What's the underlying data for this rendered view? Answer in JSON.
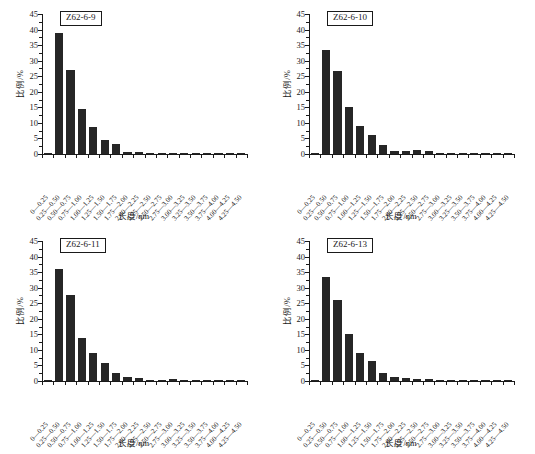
{
  "figure": {
    "panel_count": 4,
    "background_color": "#ffffff",
    "bar_color": "#262626",
    "axis_color": "#1a1a1a"
  },
  "chart_data": [
    {
      "type": "bar",
      "title": "Z62-6-9",
      "xlabel": "长度/nm",
      "ylabel": "比例/%",
      "ylim": [
        0,
        45
      ],
      "yticks": [
        0,
        5,
        10,
        15,
        20,
        25,
        30,
        35,
        40,
        45
      ],
      "grid": false,
      "legend": "none",
      "categories": [
        "0—0.25",
        "0.25—0.50",
        "0.50—0.75",
        "0.75—1.00",
        "1.00—1.25",
        "1.25—1.50",
        "1.50—1.75",
        "1.75—2.00",
        "2.00—2.25",
        "2.25—2.50",
        "2.50—2.75",
        "2.75—3.00",
        "3.00—3.25",
        "3.25—3.50",
        "3.50—3.75",
        "3.75—4.00",
        "4.00—4.25",
        "4.25—4.50"
      ],
      "values": [
        0.3,
        38.8,
        27.0,
        14.5,
        8.6,
        4.4,
        3.1,
        0.8,
        0.5,
        0.4,
        0.3,
        0.3,
        0.2,
        0.2,
        0.2,
        0.2,
        0.2,
        0.2
      ]
    },
    {
      "type": "bar",
      "title": "Z62-6-10",
      "xlabel": "长度/nm",
      "ylabel": "比例/%",
      "ylim": [
        0,
        45
      ],
      "yticks": [
        0,
        5,
        10,
        15,
        20,
        25,
        30,
        35,
        40,
        45
      ],
      "grid": false,
      "legend": "none",
      "categories": [
        "0—0.25",
        "0.25—0.50",
        "0.50—0.75",
        "0.75—1.00",
        "1.00—1.25",
        "1.25—1.50",
        "1.50—1.75",
        "1.75—2.00",
        "2.00—2.25",
        "2.25—2.50",
        "2.50—2.75",
        "2.75—3.00",
        "3.00—3.25",
        "3.25—3.50",
        "3.50—3.75",
        "3.75—4.00",
        "4.00—4.25",
        "4.25—4.50"
      ],
      "values": [
        0.4,
        33.3,
        26.8,
        15.1,
        8.9,
        6.1,
        3.0,
        1.0,
        0.9,
        1.4,
        0.9,
        0.2,
        0.2,
        0.2,
        0.2,
        0.2,
        0.2,
        0.2
      ]
    },
    {
      "type": "bar",
      "title": "Z62-6-11",
      "xlabel": "长度/nm",
      "ylabel": "比例/%",
      "ylim": [
        0,
        45
      ],
      "yticks": [
        0,
        5,
        10,
        15,
        20,
        25,
        30,
        35,
        40,
        45
      ],
      "grid": false,
      "legend": "none",
      "categories": [
        "0—0.25",
        "0.25—0.50",
        "0.50—0.75",
        "0.75—1.00",
        "1.00—1.25",
        "1.25—1.50",
        "1.50—1.75",
        "1.75—2.00",
        "2.00—2.25",
        "2.25—2.50",
        "2.50—2.75",
        "2.75—3.00",
        "3.00—3.25",
        "3.25—3.50",
        "3.50—3.75",
        "3.75—4.00",
        "4.00—4.25",
        "4.25—4.50"
      ],
      "values": [
        0.4,
        35.9,
        27.5,
        13.7,
        9.0,
        5.7,
        2.6,
        1.3,
        1.0,
        0.4,
        0.4,
        0.6,
        0.2,
        0.2,
        0.2,
        0.2,
        0.2,
        0.2
      ]
    },
    {
      "type": "bar",
      "title": "Z62-6-13",
      "xlabel": "长度/nm",
      "ylabel": "比例/%",
      "ylim": [
        0,
        45
      ],
      "yticks": [
        0,
        5,
        10,
        15,
        20,
        25,
        30,
        35,
        40,
        45
      ],
      "grid": false,
      "legend": "none",
      "categories": [
        "0—0.25",
        "0.25—0.50",
        "0.50—0.75",
        "0.75—1.00",
        "1.00—1.25",
        "1.25—1.50",
        "1.50—1.75",
        "1.75—2.00",
        "2.00—2.25",
        "2.25—2.50",
        "2.50—2.75",
        "2.75—3.00",
        "3.00—3.25",
        "3.25—3.50",
        "3.50—3.75",
        "3.75—4.00",
        "4.00—4.25",
        "4.25—4.50"
      ],
      "values": [
        0.4,
        33.3,
        26.1,
        15.2,
        9.0,
        6.5,
        2.6,
        1.2,
        1.1,
        0.6,
        0.6,
        0.2,
        0.2,
        0.2,
        0.2,
        0.2,
        0.2,
        0.2
      ]
    }
  ]
}
